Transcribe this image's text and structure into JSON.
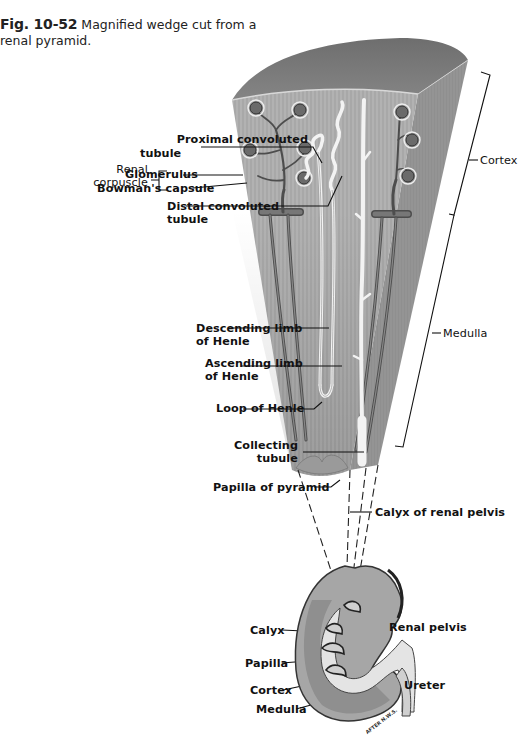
{
  "caption": {
    "figure_number": "Fig. 10-52",
    "text": "Magnified wedge cut from a renal pyramid."
  },
  "wedge_labels": {
    "proximal_convoluted_tubule": [
      "Proximal convoluted",
      "tubule"
    ],
    "renal_corpuscle": [
      "Renal",
      "corpuscle"
    ],
    "glomerulus": "Glomerulus",
    "bowmans_capsule": "Bowman's capsule",
    "distal_convoluted_tubule": [
      "Distal convoluted",
      "tubule"
    ],
    "descending_limb": [
      "Descending limb",
      "of Henle"
    ],
    "ascending_limb": [
      "Ascending limb",
      "of Henle"
    ],
    "loop_of_henle": "Loop of Henle",
    "collecting_tubule": [
      "Collecting",
      "tubule"
    ],
    "papilla_of_pyramid": "Papilla of pyramid",
    "calyx_of_renal_pelvis": "Calyx of renal pelvis"
  },
  "region_labels": {
    "cortex": "Cortex",
    "medulla": "Medulla"
  },
  "kidney_labels": {
    "calyx": "Calyx",
    "renal_pelvis": "Renal pelvis",
    "papilla": "Papilla",
    "cortex": "Cortex",
    "ureter": "Ureter",
    "medulla": "Medulla"
  },
  "artist_signature": "AFTER N.W.S.",
  "colors": {
    "tissue_front": "#a9a9a9",
    "tissue_side": "#8e8e8e",
    "tissue_top": "#777777",
    "vessel": "#555555",
    "tubule": "#f2f2f2",
    "line": "#111111"
  }
}
